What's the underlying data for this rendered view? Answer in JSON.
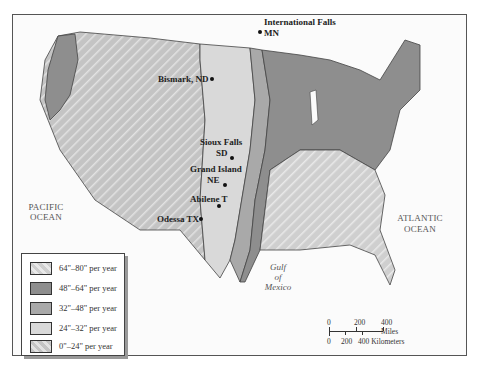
{
  "map": {
    "title": "",
    "cities": [
      {
        "name": "International Falls",
        "state": "MN"
      },
      {
        "name": "Bismark, ND"
      },
      {
        "name": "Sioux Falls",
        "state": "SD"
      },
      {
        "name": "Grand Island",
        "state": "NE"
      },
      {
        "name": "Abilene T"
      },
      {
        "name": "Odessa TX"
      }
    ],
    "oceans": {
      "pacific_line1": "PACIFIC",
      "pacific_line2": "OCEAN",
      "atlantic_line1": "ATLANTIC",
      "atlantic_line2": "OCEAN"
    },
    "gulf": {
      "line1": "Gulf",
      "line2": "of",
      "line3": "Mexico"
    }
  },
  "legend": {
    "items": [
      {
        "label": "64\"–80\" per year",
        "color": "#cfcfcf",
        "pattern": "hatched"
      },
      {
        "label": "48\"–64\" per year",
        "color": "#8e8e8e",
        "pattern": "solid"
      },
      {
        "label": "32\"–48\" per year",
        "color": "#a9a9a9",
        "pattern": "solid"
      },
      {
        "label": "24\"–32\" per year",
        "color": "#d9d9d9",
        "pattern": "solid"
      },
      {
        "label": "0\"–24\" per year",
        "color": "#c4c4c4",
        "pattern": "hatched"
      }
    ]
  },
  "scale": {
    "miles_ticks": [
      "0",
      "200",
      "400 Miles"
    ],
    "km_ticks": [
      "0",
      "200",
      "400 Kilometers"
    ]
  },
  "colors": {
    "zone_hatch": "#c8c8c8",
    "zone_dark": "#8e8e8e",
    "zone_mid": "#a9a9a9",
    "zone_light": "#d9d9d9",
    "border": "#444444"
  }
}
